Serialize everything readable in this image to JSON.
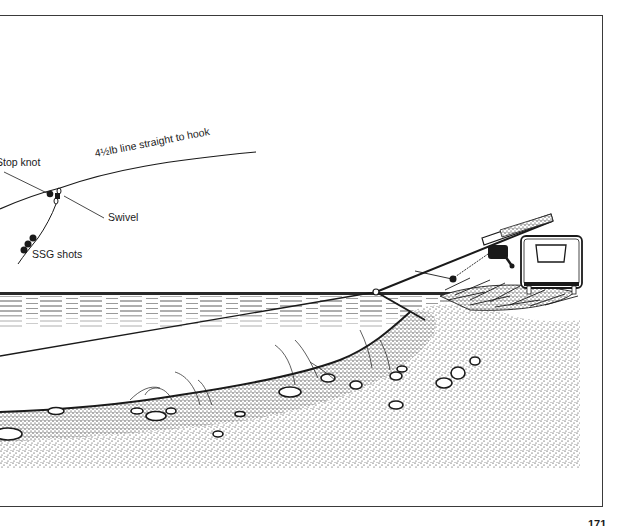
{
  "figure": {
    "callouts": {
      "stop_knot": "Stop knot",
      "line": "4½lb line straight to hook",
      "swivel": "Swivel",
      "shots": "SSG shots"
    },
    "colors": {
      "ink": "#1a1a1a",
      "frame": "#3a3a3a",
      "paper": "#ffffff"
    }
  },
  "page": {
    "number": "171"
  }
}
